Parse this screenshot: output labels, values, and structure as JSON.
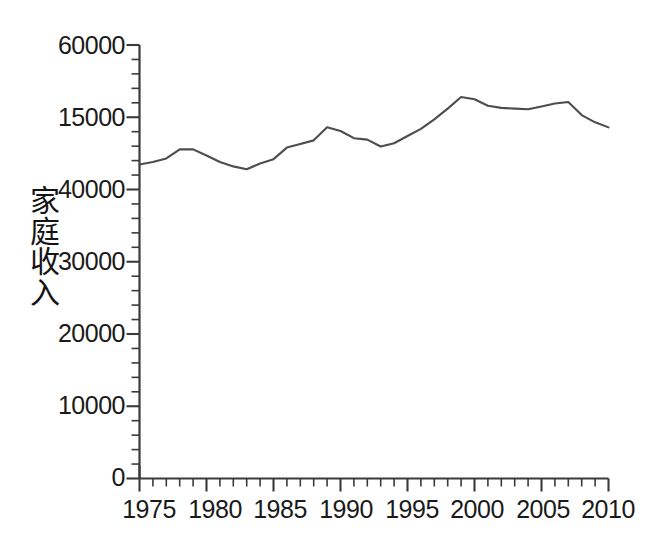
{
  "chart_data": {
    "type": "line",
    "title": "",
    "xlabel": "",
    "ylabel": "家庭收入",
    "xlim": [
      1975,
      2010
    ],
    "ylim": [
      0,
      60000
    ],
    "grid": false,
    "legend": null,
    "line_color": "#4d4d4d",
    "x_major_ticks": [
      1975,
      1980,
      1985,
      1990,
      1995,
      2000,
      2005,
      2010
    ],
    "x_minor_tick_step": 1,
    "y_major_ticks": [
      0,
      10000,
      20000,
      30000,
      40000,
      50000,
      60000
    ],
    "y_major_tick_labels": [
      "0",
      "10000",
      "20000",
      "30000",
      "40000",
      "15000",
      "60000"
    ],
    "y_minor_tick_step": 2000,
    "x": [
      1975,
      1976,
      1977,
      1978,
      1979,
      1980,
      1981,
      1982,
      1983,
      1984,
      1985,
      1986,
      1987,
      1988,
      1989,
      1990,
      1991,
      1992,
      1993,
      1994,
      1995,
      1996,
      1997,
      1998,
      1999,
      2000,
      2001,
      2002,
      2003,
      2004,
      2005,
      2006,
      2007,
      2008,
      2009,
      2010
    ],
    "values": [
      43470,
      43800,
      44300,
      45550,
      45550,
      44700,
      43800,
      43200,
      42800,
      43600,
      44200,
      45800,
      46300,
      46800,
      48600,
      48100,
      47100,
      46900,
      45950,
      46400,
      47400,
      48400,
      49700,
      51200,
      52800,
      52500,
      51600,
      51300,
      51200,
      51100,
      51500,
      51900,
      52100,
      50300,
      49300,
      48600
    ],
    "series": [
      {
        "name": "家庭收入",
        "values": [
          43470,
          43800,
          44300,
          45550,
          45550,
          44700,
          43800,
          43200,
          42800,
          43600,
          44200,
          45800,
          46300,
          46800,
          48600,
          48100,
          47100,
          46900,
          45950,
          46400,
          47400,
          48400,
          49700,
          51200,
          52800,
          52500,
          51600,
          51300,
          51200,
          51100,
          51500,
          51900,
          52100,
          50300,
          49300,
          48600
        ]
      }
    ],
    "annotations": []
  },
  "axes": {
    "y_labels": [
      "60000",
      "15000",
      "40000",
      "30000",
      "20000",
      "10000",
      "0"
    ],
    "x_labels": [
      "1975",
      "1980",
      "1985",
      "1990",
      "1995",
      "2000",
      "2005",
      "2010"
    ],
    "y_axis_title_chars": [
      "家",
      "庭",
      "收",
      "入"
    ]
  }
}
